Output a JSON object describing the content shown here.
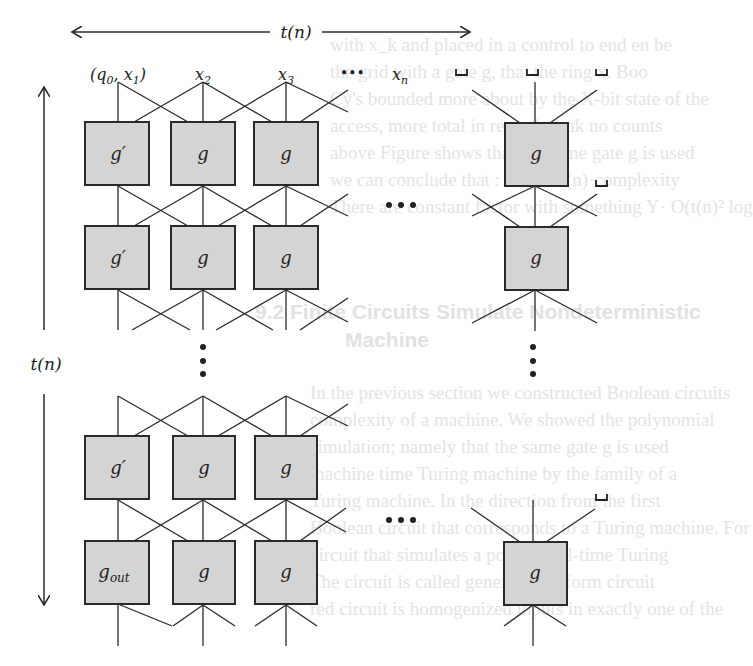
{
  "figure": {
    "horizontal_axis_label": "t(n)",
    "vertical_axis_label": "t(n)",
    "inputs": [
      {
        "label": "(q",
        "sub": "0",
        "mid": ", x",
        "sub2": "1",
        "tail": ")"
      },
      {
        "label": "x",
        "sub": "2"
      },
      {
        "label": "x",
        "sub": "3"
      },
      {
        "label": "•••"
      },
      {
        "label": "x",
        "sub": "n"
      },
      {
        "label": "␣"
      },
      {
        "label": "␣"
      },
      {
        "label": "␣"
      }
    ],
    "blank_symbol": "␣",
    "gates": {
      "first_column": [
        "g′",
        "g′",
        "g′",
        "g"
      ],
      "first_column_last_main": "g",
      "first_column_last_sub": "out",
      "other": "g"
    },
    "ellipsis_horizontal": "•••",
    "ellipsis_vertical": "⋮",
    "colors": {
      "box_fill": "#d4d4d4",
      "stroke": "#2a2a2a"
    }
  },
  "background_text": {
    "lines": [
      "with x_k and placed in a control to end en be",
      "the grid with a gate g, that the ring x. Boo",
      "Cy's bounded more about by the X-bit state of the",
      "access, more total in regards rank no counts",
      "above Figure shows that the same gate g is used",
      "we can conclude that : N(g) = t(n)·complexity",
      "There are constant factor with something Y· O(t(n)² log",
      "9.2  Finite Circuits Simulate Nondeterministic",
      "Machine",
      "In the previous section we constructed Boolean circuits",
      "complexity of a machine. We showed the polynomial",
      "simulation; namely that the same gate g is used",
      "machine time Turing machine by the family of a",
      "Turing machine. In the direction from the first",
      "Boolean circuit that corresponds to a Turing machine. For",
      "circuit that simulates a polynomial-time Turing",
      "The circuit is called generally uniform circuit",
      "red circuit is homogenized inputs in exactly one of the"
    ]
  }
}
